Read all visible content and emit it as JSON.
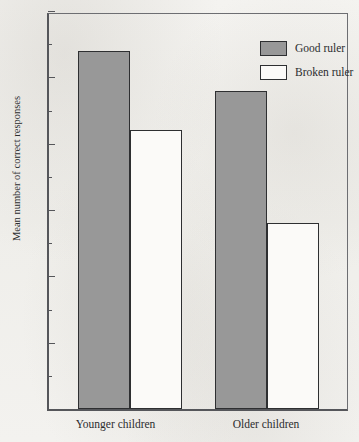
{
  "chart_data": {
    "type": "bar",
    "title": "",
    "xlabel": "",
    "ylabel": "Mean number of correct responses",
    "categories": [
      "Younger children",
      "Older children"
    ],
    "series": [
      {
        "name": "Good ruler",
        "values": [
          5.4,
          4.8
        ],
        "color": "#989898",
        "fill": "filled"
      },
      {
        "name": "Broken ruler",
        "values": [
          4.2,
          2.8
        ],
        "color": "#ffffff",
        "fill": "hollow"
      }
    ],
    "ylim": [
      0,
      6
    ],
    "y_major_ticks": [
      0,
      1,
      2,
      3,
      4,
      5,
      6
    ],
    "y_tick_labels": [
      "0",
      "1",
      "2",
      "3",
      "4",
      "5",
      "6"
    ],
    "y_minor_ticks": [
      0.5,
      1.5,
      2.5,
      3.5,
      4.5,
      5.5
    ],
    "grid": false,
    "legend_position": "top-right",
    "legend_entries": [
      "Good ruler",
      "Broken ruler"
    ]
  },
  "axes": {
    "y_title": "Mean number of correct responses",
    "x_labels": [
      "Younger children",
      "Older children"
    ]
  },
  "legend": {
    "items": [
      {
        "label": "Good ruler"
      },
      {
        "label": "Broken ruler"
      }
    ]
  },
  "colors": {
    "bar_fill_gray": "#989898",
    "bar_fill_white": "#fbfaf8",
    "bar_outline": "#2e2f31",
    "axis": "#55565a",
    "text": "#2b2c2e",
    "background": "#f2f1ee"
  }
}
